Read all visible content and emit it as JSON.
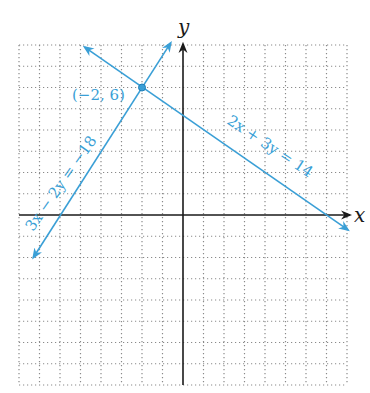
{
  "chart_data": {
    "type": "line",
    "title": "",
    "xlabel": "x",
    "ylabel": "y",
    "xlim": [
      -8,
      8
    ],
    "ylim": [
      -8,
      8
    ],
    "grid": true,
    "grid_style": "dotted",
    "tick_labels": [],
    "series": [
      {
        "name": "2x + 3y = 14",
        "label": "2x + 3y = 14",
        "equation": "2x + 3y = 14",
        "slope": -0.6667,
        "intercept": 4.6667,
        "x": [
          -4.8,
          8.05
        ],
        "y": [
          7.9,
          -0.7
        ],
        "arrows": "both",
        "color": "#3a9fd6"
      },
      {
        "name": "3x − 2y = −18",
        "label": "3x − 2y = −18",
        "equation": "3x - 2y = -18",
        "slope": 1.5,
        "intercept": 9,
        "x": [
          -7.3,
          -0.6
        ],
        "y": [
          -2.0,
          8.1
        ],
        "arrows": "both",
        "color": "#3a9fd6"
      }
    ],
    "annotations": [
      {
        "type": "point",
        "x": -2,
        "y": 6,
        "label": "(−2, 6)"
      }
    ]
  },
  "labels": {
    "x_axis": "x",
    "y_axis": "y",
    "line1": "2x + 3y = 14",
    "line2": "3x − 2y = −18",
    "intersection": "(−2, 6)"
  },
  "colors": {
    "line": "#3a9fd6",
    "axis": "#1a1a1a",
    "grid": "#8a8a8a"
  }
}
